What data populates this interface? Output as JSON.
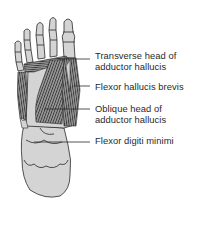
{
  "figure": {
    "colors": {
      "bone_fill": "#d4d4d4",
      "outline": "#2a2a2a",
      "muscle_fill": "#8a8a8a",
      "muscle_stripe": "#3a3a3a",
      "background": "#ffffff",
      "label_text": "#2a2a2a"
    }
  },
  "labels": [
    {
      "id": "transverse",
      "line1": "Transverse head of",
      "line2": "adductor hallucis"
    },
    {
      "id": "fhb",
      "line1": "Flexor hallucis brevis"
    },
    {
      "id": "oblique",
      "line1": "Oblique head of",
      "line2": "adductor hallucis"
    },
    {
      "id": "fdm",
      "line1": "Flexor digiti minimi"
    }
  ]
}
